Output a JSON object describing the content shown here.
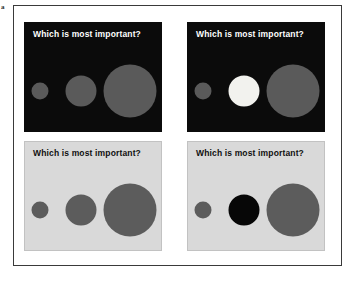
{
  "figure": {
    "label": "a",
    "frame_color": "#3a3a3a",
    "background": "#ffffff"
  },
  "panels": [
    {
      "id": "top-left",
      "position": "top-left",
      "theme": "dark",
      "background_color": "#0b0b0b",
      "title": "Which is most important?",
      "title_color": "#ffffff",
      "circles": [
        {
          "size": "small",
          "fill_color": "#5a5a5a",
          "highlighted": "no"
        },
        {
          "size": "medium",
          "fill_color": "#5a5a5a",
          "highlighted": "no"
        },
        {
          "size": "large",
          "fill_color": "#5a5a5a",
          "highlighted": "no"
        }
      ]
    },
    {
      "id": "top-right",
      "position": "top-right",
      "theme": "dark",
      "background_color": "#0b0b0b",
      "title": "Which is most important?",
      "title_color": "#ffffff",
      "circles": [
        {
          "size": "small",
          "fill_color": "#5a5a5a",
          "highlighted": "no"
        },
        {
          "size": "medium",
          "fill_color": "#f2f2ee",
          "highlighted": "yes"
        },
        {
          "size": "large",
          "fill_color": "#5a5a5a",
          "highlighted": "no"
        }
      ]
    },
    {
      "id": "bottom-left",
      "position": "bottom-left",
      "theme": "light",
      "background_color": "#d9d9d9",
      "title": "Which is most important?",
      "title_color": "#101010",
      "circles": [
        {
          "size": "small",
          "fill_color": "#5c5c5c",
          "highlighted": "no"
        },
        {
          "size": "medium",
          "fill_color": "#5c5c5c",
          "highlighted": "no"
        },
        {
          "size": "large",
          "fill_color": "#5c5c5c",
          "highlighted": "no"
        }
      ]
    },
    {
      "id": "bottom-right",
      "position": "bottom-right",
      "theme": "light",
      "background_color": "#d9d9d9",
      "title": "Which is most important?",
      "title_color": "#101010",
      "circles": [
        {
          "size": "small",
          "fill_color": "#5c5c5c",
          "highlighted": "no"
        },
        {
          "size": "medium",
          "fill_color": "#070707",
          "highlighted": "yes"
        },
        {
          "size": "large",
          "fill_color": "#5c5c5c",
          "highlighted": "no"
        }
      ]
    }
  ]
}
